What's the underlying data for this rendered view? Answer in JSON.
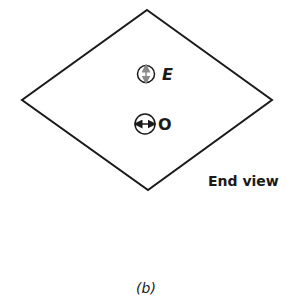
{
  "figure": {
    "caption": "(b)",
    "view_label": "End view",
    "shape": "rhombus",
    "markers": [
      {
        "label": "E",
        "symbol": "circle-with-vertical-double-arrow"
      },
      {
        "label": "O",
        "symbol": "circle-with-horizontal-double-arrow"
      }
    ],
    "colors": {
      "stroke": "#1a1a1a",
      "e_arrow": "#8a8a8a"
    }
  }
}
